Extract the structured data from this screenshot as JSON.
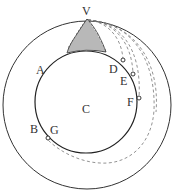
{
  "diagram": {
    "labels": {
      "V": "V",
      "A": "A",
      "B": "B",
      "C": "C",
      "D": "D",
      "E": "E",
      "F": "F",
      "G": "G"
    },
    "colors": {
      "stroke": "#333333",
      "dashed": "#777777",
      "background": "#ffffff"
    }
  }
}
